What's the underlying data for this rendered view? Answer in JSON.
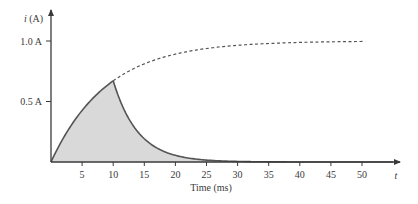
{
  "chart_data": {
    "type": "area",
    "title": "",
    "xlabel": "Time (ms)",
    "ylabel": "i (A)",
    "x_axis_end_label": "t",
    "xlim": [
      0,
      55
    ],
    "ylim": [
      0,
      1.25
    ],
    "x_ticks": [
      5,
      10,
      15,
      20,
      25,
      30,
      35,
      40,
      45,
      50
    ],
    "x_tick_labels": [
      "5",
      "10",
      "15",
      "20",
      "25",
      "30",
      "35",
      "40",
      "45",
      "50"
    ],
    "y_ticks": [
      0.5,
      1.0
    ],
    "y_tick_labels": [
      "0.5 A",
      "1.0 A"
    ],
    "grid": false,
    "legend": null,
    "series": [
      {
        "name": "charging current (solid, shaded)",
        "style": "solid",
        "x": [
          0,
          1,
          2,
          3,
          4,
          5,
          6,
          7,
          8,
          9,
          10
        ],
        "values": [
          0,
          0.105,
          0.199,
          0.283,
          0.359,
          0.427,
          0.487,
          0.541,
          0.589,
          0.632,
          0.671
        ]
      },
      {
        "name": "decay after switch (solid, shaded)",
        "style": "solid",
        "x": [
          10,
          12,
          14,
          16,
          18,
          20,
          22,
          25,
          28,
          30,
          35,
          40,
          45,
          50,
          55
        ],
        "values": [
          0.671,
          0.407,
          0.247,
          0.15,
          0.091,
          0.055,
          0.033,
          0.016,
          0.007,
          0.004,
          0.001,
          0,
          0,
          0,
          0
        ]
      },
      {
        "name": "continued charging (dashed)",
        "style": "dashed",
        "x": [
          10,
          15,
          20,
          25,
          30,
          35,
          40,
          45,
          50
        ],
        "values": [
          0.671,
          0.811,
          0.892,
          0.938,
          0.964,
          0.98,
          0.988,
          0.993,
          0.996
        ]
      }
    ],
    "annotations": [
      "Shaded area under solid curve",
      "Peak ≈ 0.67 A at t = 10 ms"
    ]
  },
  "colors": {
    "axis": "#3a3a3a",
    "curve": "#555555",
    "fill": "#d9d9d9",
    "dashed": "#555555"
  }
}
